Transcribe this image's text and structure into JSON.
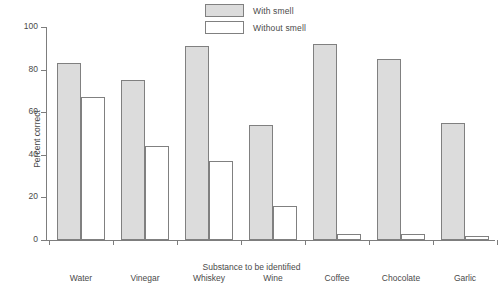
{
  "chart_data": {
    "type": "bar",
    "title": "",
    "xlabel": "Substance to be identified",
    "ylabel": "Percent correct",
    "ylim": [
      0,
      100
    ],
    "yticks": [
      0,
      20,
      40,
      60,
      80,
      100
    ],
    "grid": false,
    "legend_position": "top-center",
    "categories": [
      "Water",
      "Vinegar",
      "Whiskey",
      "Wine",
      "Coffee",
      "Chocolate",
      "Garlic"
    ],
    "series": [
      {
        "name": "With smell",
        "color": "#dcdcdc",
        "values": [
          83,
          75,
          91,
          54,
          92,
          85,
          55
        ]
      },
      {
        "name": "Without smell",
        "color": "#ffffff",
        "values": [
          67,
          44,
          37,
          16,
          3,
          3,
          2
        ]
      }
    ]
  }
}
